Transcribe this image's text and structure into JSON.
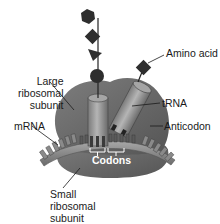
{
  "diagram": {
    "labels": {
      "large_subunit": [
        "Large",
        "ribosomal",
        "subunit"
      ],
      "amino_acid": "Amino acid",
      "trna": "tRNA",
      "mrna": "mRNA",
      "anticodon": "Anticodon",
      "codons": "Codons",
      "small_subunit": [
        "Small",
        "ribosomal",
        "subunit"
      ]
    },
    "polypeptide_chain": [
      "hexagon",
      "diamond",
      "triangle",
      "circle"
    ],
    "colors": {
      "ribosome": "#6e6e6e",
      "ribosome_dark": "#4f4f4f",
      "trna": "#9a9a9a",
      "amino_acid": "#2e2e2e",
      "mrna": "#8a8a8a",
      "label_text": "#1a1a1a",
      "leader_line": "#1a1a1a"
    }
  }
}
